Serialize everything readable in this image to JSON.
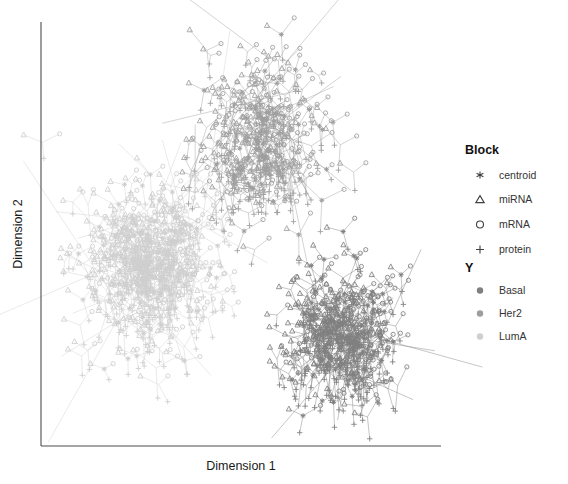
{
  "figure": {
    "type": "scatter-network",
    "background": "#ffffff",
    "width": 568,
    "height": 484
  },
  "axes": {
    "xlabel": "Dimension 1",
    "ylabel": "Dimension 2",
    "x_tick_labels": [],
    "y_tick_labels": [],
    "grid": false,
    "frame": "L-shape",
    "axis_color": "#4d4d4d"
  },
  "legends": [
    {
      "name": "block-legend",
      "title": "Block",
      "items": [
        {
          "label": "centroid",
          "symbol": "asterisk"
        },
        {
          "label": "miRNA",
          "symbol": "triangle"
        },
        {
          "label": "mRNA",
          "symbol": "circle"
        },
        {
          "label": "protein",
          "symbol": "plus"
        }
      ]
    },
    {
      "name": "class-legend",
      "title": "Y",
      "items": [
        {
          "label": "Basal",
          "symbol": "dot",
          "color": "#808080"
        },
        {
          "label": "Her2",
          "symbol": "dot",
          "color": "#9e9e9e"
        },
        {
          "label": "LumA",
          "symbol": "dot",
          "color": "#cfcfcf"
        }
      ]
    }
  ],
  "chart_data": {
    "type": "scatter",
    "title": "",
    "xlabel": "Dimension 1",
    "ylabel": "Dimension 2",
    "xlim": [
      0,
      100
    ],
    "ylim": [
      0,
      100
    ],
    "grid": false,
    "legend_position": "right",
    "blocks": [
      "centroid",
      "miRNA",
      "mRNA",
      "protein"
    ],
    "classes": [
      "Basal",
      "Her2",
      "LumA"
    ],
    "class_colors": {
      "Basal": "#808080",
      "Her2": "#9e9e9e",
      "LumA": "#cfcfcf"
    },
    "clusters": [
      {
        "name": "LumA",
        "color": "#cfcfcf",
        "center": [
          27,
          42
        ],
        "spread": [
          13,
          17
        ],
        "n": 300,
        "description": "large diffuse light-gray cluster at left-centre"
      },
      {
        "name": "Her2",
        "color": "#9e9e9e",
        "center": [
          55,
          72
        ],
        "spread": [
          13,
          17
        ],
        "n": 190,
        "description": "medium-gray cluster upper-middle with long connecting segments"
      },
      {
        "name": "Basal",
        "color": "#808080",
        "center": [
          75,
          26
        ],
        "spread": [
          11,
          13
        ],
        "n": 230,
        "description": "dark-gray dense cluster lower-right"
      }
    ],
    "edges": {
      "drawn": true,
      "description": "thin straight segments linking each sample's block markers to its class centroid",
      "stroke_width": 0.45
    }
  }
}
